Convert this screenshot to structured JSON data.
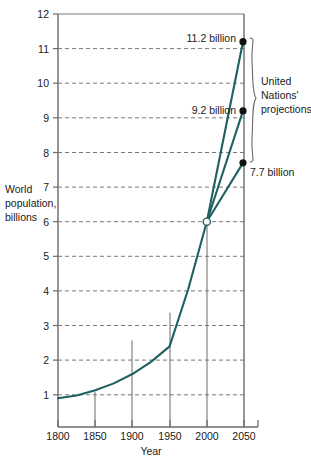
{
  "chart_data": {
    "type": "line",
    "title": "",
    "xlabel": "Year",
    "ylabel": "World population, billions",
    "ylabel_lines": [
      "World",
      "population,",
      "billions"
    ],
    "xlim": [
      1795,
      2055
    ],
    "ylim": [
      0.07,
      12
    ],
    "grid": true,
    "grid_style": "dashed-horizontal",
    "legend": "none",
    "x_ticks": [
      1800,
      1850,
      1900,
      1950,
      2000,
      2050
    ],
    "x_tick_labels": [
      "1800",
      "1850",
      "1900",
      "1950",
      "2000",
      "2050"
    ],
    "y_ticks": [
      1,
      2,
      3,
      4,
      5,
      6,
      7,
      8,
      9,
      10,
      11,
      12
    ],
    "y_tick_labels": [
      "1",
      "2",
      "3",
      "4",
      "5",
      "6",
      "7",
      "8",
      "9",
      "10",
      "11",
      "12"
    ],
    "line_color": "#1f6160",
    "series": [
      {
        "name": "Historical world population",
        "x": [
          1800,
          1825,
          1850,
          1875,
          1900,
          1925,
          1950,
          1975,
          2000
        ],
        "values": [
          0.9,
          0.98,
          1.13,
          1.33,
          1.6,
          1.95,
          2.4,
          4.05,
          6.0
        ]
      },
      {
        "name": "UN high projection",
        "x": [
          2000,
          2050
        ],
        "values": [
          6.0,
          11.2
        ]
      },
      {
        "name": "UN medium projection",
        "x": [
          2000,
          2050
        ],
        "values": [
          6.0,
          9.2
        ]
      },
      {
        "name": "UN low projection",
        "x": [
          2000,
          2050
        ],
        "values": [
          6.0,
          7.7
        ]
      }
    ],
    "annotations": [
      {
        "text": "11.2 billion",
        "x": 2050,
        "y": 11.2,
        "position": "left"
      },
      {
        "text": "9.2 billion",
        "x": 2050,
        "y": 9.2,
        "position": "left"
      },
      {
        "text": "7.7 billion",
        "x": 2050,
        "y": 7.7,
        "position": "right"
      }
    ],
    "brace_annotation": {
      "lines": [
        "United",
        "Nations'",
        "projections"
      ],
      "spans_from": 7.7,
      "spans_to": 11.2
    },
    "branch_point": {
      "x": 2000,
      "y": 6.0,
      "marker": "open-circle"
    },
    "drop_lines_at": [
      1850,
      1900,
      1950,
      2000
    ]
  },
  "annotation_texts": {
    "high": "11.2 billion",
    "medium": "9.2 billion",
    "low": "7.7 billion",
    "brace_line1": "United",
    "brace_line2": "Nations'",
    "brace_line3": "projections"
  },
  "axis_titles": {
    "x": "Year",
    "y_line1": "World",
    "y_line2": "population,",
    "y_line3": "billions"
  },
  "y_tick_text": {
    "t1": "1",
    "t2": "2",
    "t3": "3",
    "t4": "4",
    "t5": "5",
    "t6": "6",
    "t7": "7",
    "t8": "8",
    "t9": "9",
    "t10": "10",
    "t11": "11",
    "t12": "12"
  },
  "x_tick_text": {
    "t1800": "1800",
    "t1850": "1850",
    "t1900": "1900",
    "t1950": "1950",
    "t2000": "2000",
    "t2050": "2050"
  },
  "colors": {
    "line": "#1f6160",
    "axis": "#6b6b6b",
    "grid": "#7a7a7a",
    "marker": "#111111",
    "text": "#1a1a1a"
  }
}
